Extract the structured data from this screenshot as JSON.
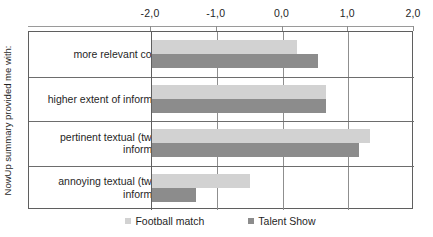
{
  "chart_data": {
    "type": "bar",
    "orientation": "horizontal",
    "title": "",
    "subtitle": "",
    "xlabel": "",
    "ylabel": "NowUp summary provided me with:",
    "categories": [
      "more relevant content",
      "higher extent of information",
      "pertinent textual (tweets) information",
      "annoying textual (tweets) information"
    ],
    "category_lines": [
      [
        "more relevant content"
      ],
      [
        "higher extent of information"
      ],
      [
        "pertinent textual (tweets)",
        "information"
      ],
      [
        "annoying textual (tweets)",
        "information"
      ]
    ],
    "series": [
      {
        "name": "Football match",
        "color": "#d2d2d2",
        "values": [
          0.22,
          0.66,
          1.33,
          -0.5
        ]
      },
      {
        "name": "Talent Show",
        "color": "#8c8c8c",
        "values": [
          0.54,
          0.66,
          1.17,
          -1.31
        ]
      }
    ],
    "xlim": [
      -2.0,
      2.0
    ],
    "xticks": [
      -2.0,
      -1.0,
      0.0,
      1.0,
      2.0
    ],
    "xtick_labels": [
      "-2,0",
      "-1,0",
      "0,0",
      "1,0",
      "2,0"
    ],
    "bar_baseline": -2.0,
    "grid": "vertical",
    "legend_position": "bottom",
    "axis_position": "top"
  },
  "legend": {
    "entries": [
      {
        "label": "Football match",
        "swatch": "legend-swatch-football"
      },
      {
        "label": "Talent Show",
        "swatch": "legend-swatch-talent"
      }
    ]
  }
}
